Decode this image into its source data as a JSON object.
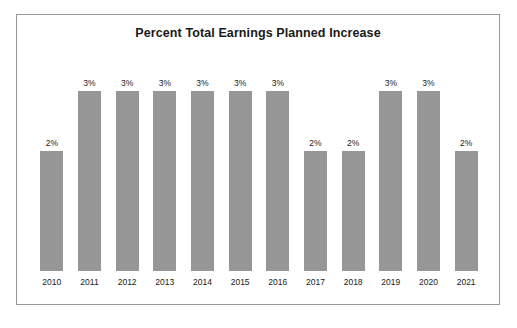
{
  "chart_data": {
    "type": "bar",
    "title": "Percent Total Earnings Planned Increase",
    "xlabel": "",
    "ylabel": "",
    "categories": [
      "2010",
      "2011",
      "2012",
      "2013",
      "2014",
      "2015",
      "2016",
      "2017",
      "2018",
      "2019",
      "2020",
      "2021"
    ],
    "values": [
      2,
      3,
      3,
      3,
      3,
      3,
      3,
      2,
      2,
      3,
      3,
      2
    ],
    "value_labels": [
      "2%",
      "3%",
      "3%",
      "3%",
      "3%",
      "3%",
      "3%",
      "2%",
      "2%",
      "3%",
      "3%",
      "2%"
    ],
    "ylim": [
      0,
      3.75
    ],
    "grid": false,
    "legend": "none",
    "unit": "%",
    "bar_color": "#969696",
    "background_color": "#ffffff",
    "border_color": "#999999",
    "text_color": "#1a1a1a"
  }
}
